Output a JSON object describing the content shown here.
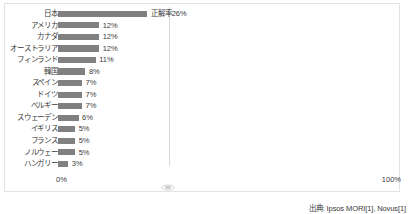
{
  "chart_data": {
    "type": "bar",
    "orientation": "horizontal",
    "title": "",
    "xlabel": "",
    "ylabel": "",
    "xlim": [
      0,
      100
    ],
    "xticks": [
      "0%",
      "100%"
    ],
    "grid": true,
    "gridlines_at": [
      100
    ],
    "series_label": "正解率",
    "first_bar_label": "正解率26%",
    "categories": [
      "日本",
      "アメリカ",
      "カナダ",
      "オーストラリア",
      "フィンランド",
      "韓国",
      "スペイン",
      "ドイツ",
      "ベルギー",
      "スウェーデン",
      "イギリス",
      "フランス",
      "ノルウェー",
      "ハンガリー"
    ],
    "values": [
      26,
      12,
      12,
      12,
      11,
      8,
      7,
      7,
      7,
      6,
      5,
      5,
      5,
      3
    ],
    "value_labels": [
      "正解率26%",
      "12%",
      "12%",
      "12%",
      "11%",
      "8%",
      "7%",
      "7%",
      "7%",
      "6%",
      "5%",
      "5%",
      "5%",
      "3%"
    ],
    "bar_color": "#808080",
    "legend": []
  },
  "axis": {
    "left_tick": "0%",
    "right_tick": "100%"
  },
  "source": {
    "note": "出典: Ipsos MORI[1], Novus[1]"
  },
  "watermark": {
    "name": "decorative-glyph"
  }
}
